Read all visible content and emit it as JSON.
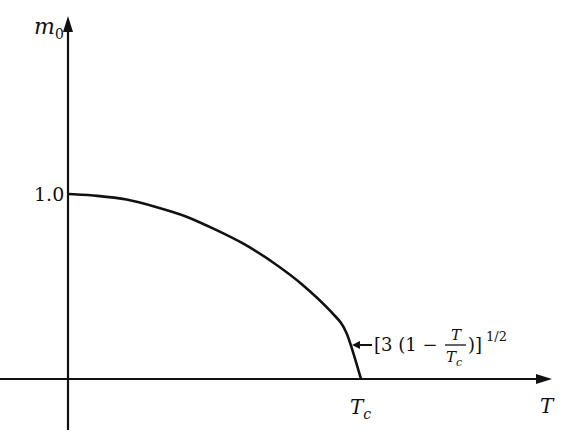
{
  "chart_data": {
    "type": "line",
    "title": "",
    "xlabel": "T",
    "ylabel": "m0",
    "x_tick_labels": [
      "Tc"
    ],
    "y_tick_labels": [
      "1.0"
    ],
    "grid": false,
    "legend": null,
    "annotations": [
      {
        "text": "[3 (1 − T/Tc)]^1/2",
        "points_to": "curve near T = Tc"
      }
    ],
    "series": [
      {
        "name": "m0(T)",
        "x_normalized_T_over_Tc": [
          0.0,
          0.1,
          0.2,
          0.3,
          0.4,
          0.5,
          0.6,
          0.7,
          0.8,
          0.9,
          0.95,
          1.0
        ],
        "values": [
          1.0,
          0.99,
          0.97,
          0.93,
          0.88,
          0.81,
          0.73,
          0.63,
          0.51,
          0.36,
          0.25,
          0.0
        ]
      }
    ],
    "xlim_normalized": [
      0,
      1.25
    ],
    "ylim": [
      0,
      1.8
    ]
  },
  "labels": {
    "y_axis": "m",
    "y_axis_sub": "0",
    "x_axis": "T",
    "y_tick": "1.0",
    "x_tick": "T",
    "x_tick_sub": "c",
    "annotation_prefix": "[3 (1 − ",
    "annotation_num": "T",
    "annotation_den": "T",
    "annotation_den_sub": "c",
    "annotation_suffix": ")]",
    "annotation_exp": "1/2"
  },
  "colors": {
    "ink": "#111111",
    "background": "#ffffff"
  }
}
